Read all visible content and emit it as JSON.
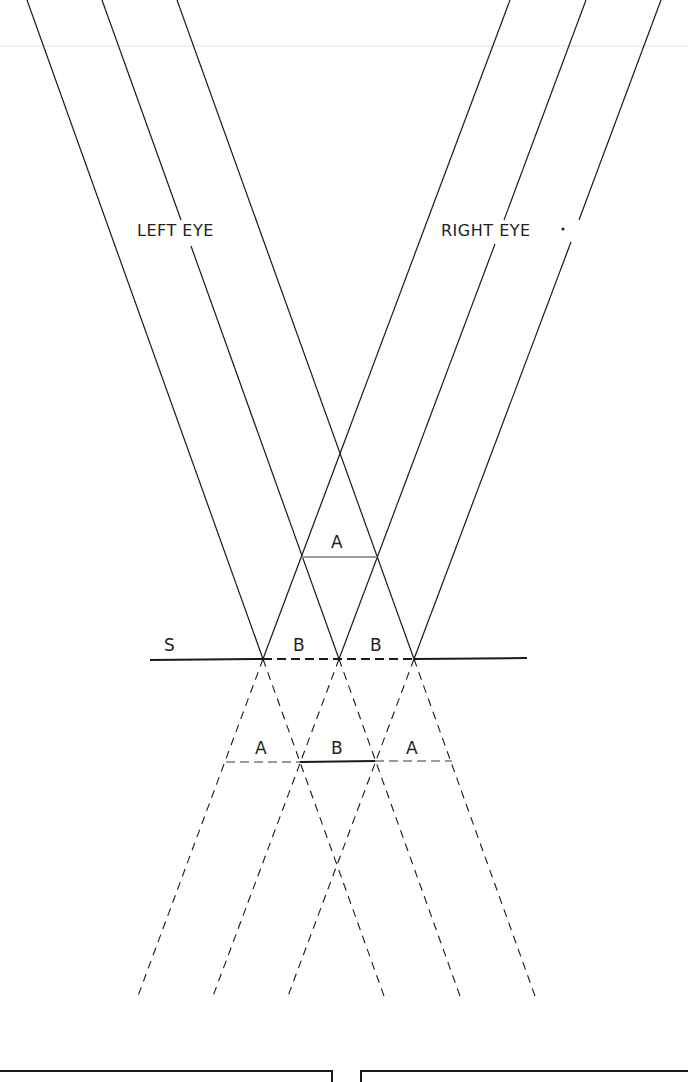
{
  "diagram": {
    "labels": {
      "left_eye": "LEFT EYE",
      "right_eye": "RIGHT EYE",
      "screen": "S",
      "region_a_top": "A",
      "region_b_left": "B",
      "region_b_right": "B",
      "region_a_lower_left": "A",
      "region_b_lower": "B",
      "region_a_lower_right": "A"
    },
    "left_eye_rays": [
      {
        "x_top": 27,
        "x_screen": 263
      },
      {
        "x_top": 102,
        "x_screen": 339
      },
      {
        "x_top": 177,
        "x_screen": 414
      }
    ],
    "right_eye_rays": [
      {
        "x_top": 510,
        "x_screen": 263
      },
      {
        "x_top": 586,
        "x_screen": 339
      },
      {
        "x_top": 661,
        "x_screen": 414
      }
    ],
    "screen_line": {
      "y": 659,
      "x_start": 150,
      "x_end": 527,
      "dashed_segment": [
        263,
        414
      ]
    },
    "upper_fusion_line": {
      "y": 557,
      "x_start": 302,
      "x_end": 377
    },
    "lower_fusion_line": {
      "y": 761,
      "solid_segment": [
        300,
        375
      ],
      "dashed_left": [
        226,
        300
      ],
      "dashed_right": [
        375,
        452
      ]
    },
    "ray_extension_end_y": 996,
    "colors": {
      "line": "#1a1a1a",
      "gray_line": "#9a9a9a",
      "background": "#ffffff"
    }
  }
}
